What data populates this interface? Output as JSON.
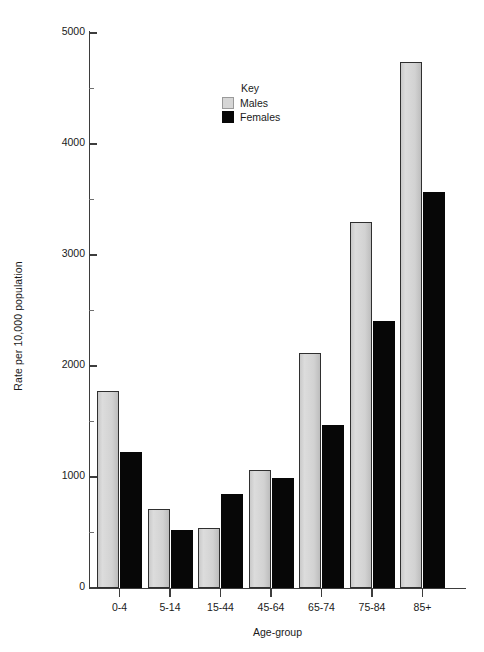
{
  "chart_data": {
    "type": "bar",
    "title": "",
    "xlabel": "Age-group",
    "ylabel": "Rate per 10,000 population",
    "categories": [
      "0-4",
      "5-14",
      "15-44",
      "45-64",
      "65-74",
      "75-84",
      "85+"
    ],
    "series": [
      {
        "name": "Males",
        "color": "#d6d6d6",
        "values": [
          1775,
          710,
          540,
          1060,
          2115,
          3300,
          4740
        ]
      },
      {
        "name": "Females",
        "color": "#070707",
        "values": [
          1225,
          525,
          850,
          990,
          1470,
          2410,
          3570
        ]
      }
    ],
    "ylim": [
      0,
      5000
    ],
    "yticks": [
      0,
      1000,
      2000,
      3000,
      4000,
      5000
    ],
    "ytick_labels": [
      "0",
      "1000",
      "2000",
      "3000",
      "4000",
      "5000"
    ],
    "yticks_minor": [
      500,
      1500,
      2500,
      3500,
      4500
    ],
    "grid": false,
    "legend": {
      "title": "Key",
      "position": "inside-top-center",
      "entries": [
        {
          "label": "Males",
          "swatch": "light-gray"
        },
        {
          "label": "Females",
          "swatch": "black"
        }
      ]
    }
  }
}
